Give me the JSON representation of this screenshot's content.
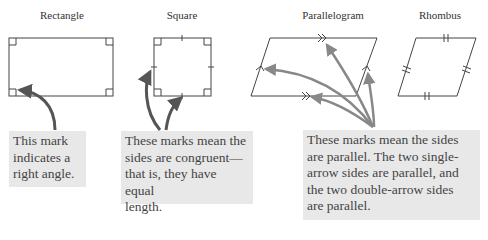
{
  "titles": {
    "rectangle": "Rectangle",
    "square": "Square",
    "parallelogram": "Parallelogram",
    "rhombus": "Rhombus"
  },
  "callouts": {
    "right_angle": [
      "This mark",
      "indicates a",
      "right angle."
    ],
    "congruent": [
      "These marks mean the",
      "sides are congruent—",
      "that is, they have equal",
      "length."
    ],
    "parallel": [
      "These marks mean the sides",
      "are parallel. The two single-",
      "arrow sides are parallel, and",
      "the two double-arrow sides",
      "are parallel."
    ]
  },
  "colors": {
    "shape_stroke": "#444444",
    "arrow_dark": "#555555",
    "arrow_gray": "#888888",
    "callout_bg": "#e8e8e8"
  }
}
